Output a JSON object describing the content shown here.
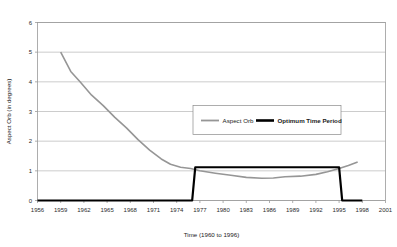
{
  "chart_data": {
    "type": "line",
    "title": "",
    "xlabel": "Time (1960 to 1996)",
    "ylabel": "Aspect Orb (in degrees)",
    "xlim": [
      1956,
      2001
    ],
    "ylim": [
      0,
      6
    ],
    "xticks": [
      1956,
      1959,
      1962,
      1965,
      1968,
      1971,
      1974,
      1977,
      1980,
      1983,
      1986,
      1989,
      1992,
      1995,
      1998,
      2001
    ],
    "yticks": [
      0,
      1,
      2,
      3,
      4,
      5,
      6
    ],
    "grid": "horizontal",
    "legend_position": "upper-right-inside",
    "series": [
      {
        "name": "Aspect Orb",
        "color": "#969696",
        "width": 1.6,
        "points": [
          [
            1959.0,
            5.0
          ],
          [
            1960.3,
            4.35
          ],
          [
            1961.5,
            4.0
          ],
          [
            1963.0,
            3.55
          ],
          [
            1964.5,
            3.2
          ],
          [
            1966.0,
            2.8
          ],
          [
            1967.5,
            2.45
          ],
          [
            1969.0,
            2.05
          ],
          [
            1970.5,
            1.7
          ],
          [
            1972.0,
            1.4
          ],
          [
            1973.2,
            1.22
          ],
          [
            1974.5,
            1.12
          ],
          [
            1975.8,
            1.08
          ],
          [
            1977.0,
            1.0
          ],
          [
            1979.0,
            0.92
          ],
          [
            1981.0,
            0.85
          ],
          [
            1983.0,
            0.78
          ],
          [
            1985.0,
            0.75
          ],
          [
            1986.5,
            0.76
          ],
          [
            1988.0,
            0.8
          ],
          [
            1990.0,
            0.82
          ],
          [
            1992.0,
            0.88
          ],
          [
            1993.5,
            0.97
          ],
          [
            1995.0,
            1.08
          ],
          [
            1996.2,
            1.18
          ],
          [
            1997.4,
            1.3
          ]
        ]
      },
      {
        "name": "Optimum Time Period",
        "color": "#000000",
        "width": 2.2,
        "points": [
          [
            1956.0,
            0.0
          ],
          [
            1976.0,
            0.0
          ],
          [
            1976.4,
            1.12
          ],
          [
            1995.0,
            1.12
          ],
          [
            1995.4,
            0.0
          ],
          [
            1998.0,
            0.0
          ]
        ]
      }
    ]
  },
  "legend": {
    "items": [
      {
        "label": "Aspect Orb",
        "color": "#969696",
        "weight": "normal"
      },
      {
        "label": "Optimum Time Period",
        "color": "#000000",
        "weight": "bold"
      }
    ]
  },
  "colors": {
    "plot_border": "#9a9a9a",
    "gridline": "#b6b6b6",
    "axis_text": "#2b2b2b",
    "background": "#ffffff",
    "series_gray": "#969696",
    "series_black": "#000000"
  }
}
